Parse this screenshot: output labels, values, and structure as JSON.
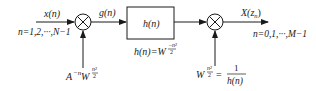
{
  "diagram": {
    "type": "signal-flow / chirp-z transform block diagram",
    "input": {
      "signal_label": "x(n)",
      "range_label": "n=1,2,···,N−1"
    },
    "multiplier1": {
      "symbol": "⊗",
      "weight_base": "A",
      "weight_base_exp": "−n",
      "weight_w": "W",
      "weight_w_exp_num": "n²",
      "weight_w_exp_den": "2"
    },
    "intermediate": {
      "signal_label": "g(n)"
    },
    "filter": {
      "box_label": "h(n)",
      "definition_lhs": "h(n)=W",
      "definition_exp_num": "−n²",
      "definition_exp_den": "2"
    },
    "multiplier2": {
      "symbol": "⊗",
      "weight_w": "W",
      "weight_w_exp_num": "n²",
      "weight_w_exp_den": "2",
      "equals": "=",
      "fraction_num": "1",
      "fraction_den": "h(n)"
    },
    "output": {
      "signal_label": "X(z",
      "signal_sub": "n",
      "signal_close": ")",
      "range_label": "n=0,1,···,M−1"
    },
    "colors": {
      "stroke": "#1a1a1a",
      "background": "#ffffff"
    }
  }
}
